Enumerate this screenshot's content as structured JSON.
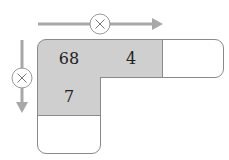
{
  "diagram": {
    "type": "multiplication-table",
    "operator_symbol": "×",
    "horizontal_arrow": {
      "operator": "×",
      "direction": "right"
    },
    "vertical_arrow": {
      "operator": "×",
      "direction": "down"
    },
    "cells": {
      "r1c1": "68",
      "r1c2": "4",
      "r1c3": "",
      "r2c1": "7",
      "r3c1": ""
    },
    "colors": {
      "filled_cell": "#cfcfcf",
      "arrow": "#a8a8a8",
      "border": "#8a8a8a"
    }
  }
}
